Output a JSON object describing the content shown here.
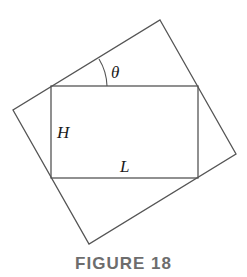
{
  "figure": {
    "caption": "FIGURE 18",
    "labels": {
      "angle": "θ",
      "height": "H",
      "length": "L"
    },
    "colors": {
      "stroke": "#555555",
      "caption": "#6d6d6d"
    },
    "outer_rectangle": {
      "vertices": [
        [
          160,
          20
        ],
        [
          236,
          154
        ],
        [
          89,
          244
        ],
        [
          13,
          110
        ]
      ]
    },
    "inner_rectangle": {
      "vertices": [
        [
          51,
          86
        ],
        [
          198,
          86
        ],
        [
          198,
          178
        ],
        [
          51,
          178
        ]
      ]
    }
  }
}
